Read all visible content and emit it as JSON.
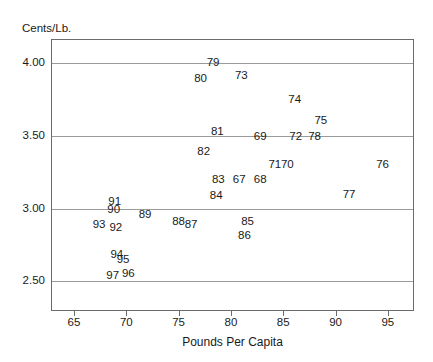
{
  "chart_data": {
    "type": "scatter",
    "title": "",
    "xlabel": "Pounds Per Capita",
    "ylabel": "Cents/Lb.",
    "xlim": [
      62.8,
      97.5
    ],
    "ylim": [
      2.29,
      4.16
    ],
    "xticks": [
      65,
      70,
      75,
      80,
      85,
      90,
      95
    ],
    "xtick_labels": [
      "65",
      "70",
      "75",
      "80",
      "85",
      "90",
      "95"
    ],
    "yticks": [
      2.5,
      3.0,
      3.5,
      4.0
    ],
    "ytick_labels": [
      "2.50",
      "3.00",
      "3.50",
      "4.00"
    ],
    "grid": "horizontal",
    "legend": "none",
    "marker_style": "text-label-only",
    "point_label_meaning": "two-digit year",
    "points": [
      {
        "label": "79",
        "x": 78.2,
        "y": 4.0
      },
      {
        "label": "80",
        "x": 77.0,
        "y": 3.895
      },
      {
        "label": "73",
        "x": 80.9,
        "y": 3.91
      },
      {
        "label": "74",
        "x": 86.0,
        "y": 3.745
      },
      {
        "label": "75",
        "x": 88.5,
        "y": 3.605
      },
      {
        "label": "81",
        "x": 78.6,
        "y": 3.525
      },
      {
        "label": "69",
        "x": 82.7,
        "y": 3.495
      },
      {
        "label": "72",
        "x": 86.1,
        "y": 3.495
      },
      {
        "label": "78",
        "x": 87.9,
        "y": 3.495
      },
      {
        "label": "82",
        "x": 77.3,
        "y": 3.39
      },
      {
        "label": "71",
        "x": 84.1,
        "y": 3.3
      },
      {
        "label": "70",
        "x": 85.3,
        "y": 3.3
      },
      {
        "label": "76",
        "x": 94.4,
        "y": 3.3
      },
      {
        "label": "83",
        "x": 78.7,
        "y": 3.195
      },
      {
        "label": "67",
        "x": 80.7,
        "y": 3.195
      },
      {
        "label": "68",
        "x": 82.7,
        "y": 3.195
      },
      {
        "label": "84",
        "x": 78.5,
        "y": 3.085
      },
      {
        "label": "77",
        "x": 91.2,
        "y": 3.095
      },
      {
        "label": "91",
        "x": 68.8,
        "y": 3.045
      },
      {
        "label": "90",
        "x": 68.7,
        "y": 2.99
      },
      {
        "label": "89",
        "x": 71.7,
        "y": 2.96
      },
      {
        "label": "88",
        "x": 74.9,
        "y": 2.91
      },
      {
        "label": "87",
        "x": 76.1,
        "y": 2.89
      },
      {
        "label": "85",
        "x": 81.5,
        "y": 2.91
      },
      {
        "label": "86",
        "x": 81.2,
        "y": 2.815
      },
      {
        "label": "93",
        "x": 67.3,
        "y": 2.885
      },
      {
        "label": "92",
        "x": 68.9,
        "y": 2.87
      },
      {
        "label": "94",
        "x": 69.0,
        "y": 2.685
      },
      {
        "label": "95",
        "x": 69.6,
        "y": 2.645
      },
      {
        "label": "97",
        "x": 68.6,
        "y": 2.535
      },
      {
        "label": "96",
        "x": 70.1,
        "y": 2.55
      }
    ]
  },
  "axis": {
    "y_caption": "Cents/Lb.",
    "x_title": "Pounds Per Capita"
  }
}
